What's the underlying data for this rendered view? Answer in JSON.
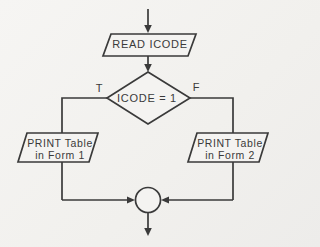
{
  "diagram": {
    "type": "flowchart",
    "colors": {
      "background": "#f3f2ef",
      "line": "#3a3a3a",
      "text": "#3a3a3a"
    },
    "nodes": {
      "read": {
        "shape": "parallelogram-io",
        "label": "READ ICODE"
      },
      "decision": {
        "shape": "diamond",
        "label": "ICODE = 1",
        "true_branch_label": "T",
        "false_branch_label": "F"
      },
      "print_form1": {
        "shape": "parallelogram-io",
        "label_line1": "PRINT Table",
        "label_line2": "in Form 1"
      },
      "print_form2": {
        "shape": "parallelogram-io",
        "label_line1": "PRINT Table",
        "label_line2": "in Form 2"
      },
      "merge": {
        "shape": "circle-connector",
        "label": ""
      }
    }
  }
}
